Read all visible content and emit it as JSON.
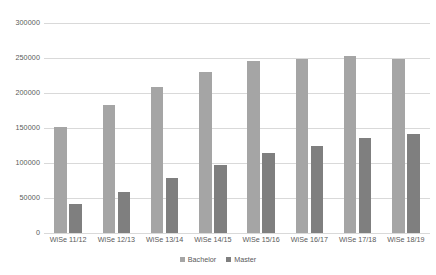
{
  "chart_data": {
    "type": "bar",
    "title": "",
    "subtitle": "",
    "xlabel": "",
    "ylabel": "",
    "categories": [
      "WiSe 11/12",
      "WiSe 12/13",
      "WiSe 13/14",
      "WiSe 14/15",
      "WiSe 15/16",
      "WiSe 16/17",
      "WiSe 17/18",
      "WiSe 18/19"
    ],
    "series": [
      {
        "name": "Bachelor",
        "color": "#a5a5a5",
        "values": [
          152000,
          183000,
          208000,
          230000,
          246000,
          249000,
          253000,
          248000
        ]
      },
      {
        "name": "Master",
        "color": "#7f7f7f",
        "values": [
          41000,
          58000,
          78000,
          97000,
          114000,
          124000,
          136000,
          142000
        ]
      }
    ],
    "ylim": [
      0,
      300000
    ],
    "ytick_values": [
      0,
      50000,
      100000,
      150000,
      200000,
      250000,
      300000
    ],
    "ytick_labels": [
      "0",
      "50000",
      "100000",
      "150000",
      "200000",
      "250000",
      "300000"
    ],
    "grid": true,
    "grid_axis": "y",
    "legend": {
      "position": "bottom",
      "entries": [
        "Bachelor",
        "Master"
      ]
    },
    "axis_label_color": "#595959",
    "gridline_color": "#d9d9d9",
    "background_color": "#ffffff"
  }
}
